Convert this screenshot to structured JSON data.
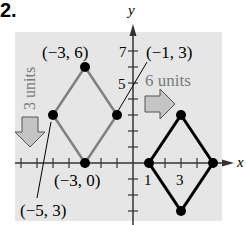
{
  "problem_number": "2.",
  "axes": {
    "x_label": "x",
    "y_label": "y",
    "x_tick_labels": [
      {
        "value": 1,
        "label": "1"
      },
      {
        "value": 3,
        "label": "3"
      }
    ],
    "y_tick_labels": [
      {
        "value": 5,
        "label": "5"
      },
      {
        "value": 7,
        "label": "7"
      }
    ]
  },
  "original_shape": {
    "color": "#808080",
    "vertices": [
      {
        "label": "(−3, 6)",
        "x": -3,
        "y": 6
      },
      {
        "label": "(−1, 3)",
        "x": -1,
        "y": 3
      },
      {
        "label": "(−3, 0)",
        "x": -3,
        "y": 0
      },
      {
        "label": "(−5, 3)",
        "x": -5,
        "y": 3
      }
    ]
  },
  "translated_shape": {
    "color": "#000000",
    "vertices": [
      {
        "x": 3,
        "y": 3
      },
      {
        "x": 5,
        "y": 0
      },
      {
        "x": 3,
        "y": -3
      },
      {
        "x": 1,
        "y": 0
      }
    ]
  },
  "annotations": {
    "down_shift": "3 units",
    "right_shift": "6 units"
  },
  "colors": {
    "background_panel": "#e6e6e6",
    "arrow_fill": "#c4c4c4",
    "gray_text": "#7a7a7a"
  }
}
